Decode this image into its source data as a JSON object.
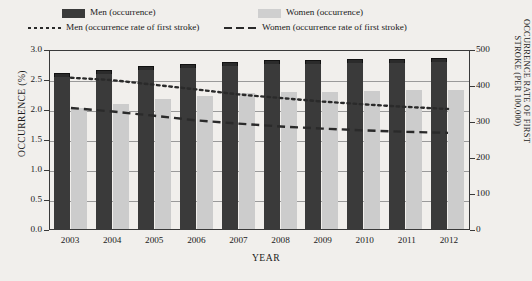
{
  "legend": {
    "entries": [
      {
        "name": "men-occurrence",
        "label": "Men (occurrence)",
        "marker": "solid-swatch-dark"
      },
      {
        "name": "women-occurrence",
        "label": "Women (occurrence)",
        "marker": "solid-swatch-light"
      },
      {
        "name": "men-rate",
        "label": "Men (occurrence rate of first stroke)",
        "marker": "dotted-line"
      },
      {
        "name": "women-rate",
        "label": "Women (occurrence rate of first stroke)",
        "marker": "dashed-line"
      }
    ]
  },
  "colors": {
    "men_bar": "#3a3a3a",
    "women_bar": "#cccccc",
    "line": "#2a2a2a",
    "axis": "#3a3a3a",
    "grid": "#9a9a9a",
    "background": "#f1efec"
  },
  "chart_data": {
    "type": "bar",
    "title": "",
    "xlabel": "YEAR",
    "ylabel": "OCCURRENCE (%)",
    "ylabel_right": "OCCURRENCE RATE OF FIRST STROKE (PER 100,000)",
    "categories": [
      "2003",
      "2004",
      "2005",
      "2006",
      "2007",
      "2008",
      "2009",
      "2010",
      "2011",
      "2012"
    ],
    "ylim": [
      0,
      3.0
    ],
    "yticks": [
      "0.0",
      "0.5",
      "1.0",
      "1.5",
      "2.0",
      "2.5",
      "3.0"
    ],
    "ylim_right": [
      0,
      500
    ],
    "yticks_right": [
      "0",
      "100",
      "200",
      "300",
      "400",
      "500"
    ],
    "grid": true,
    "legend_position": "top",
    "series": [
      {
        "name": "Men (occurrence)",
        "axis": "left",
        "unit": "%",
        "type": "bar",
        "values": [
          2.57,
          2.62,
          2.68,
          2.72,
          2.75,
          2.78,
          2.79,
          2.8,
          2.8,
          2.81
        ],
        "error_bars": true
      },
      {
        "name": "Women (occurrence)",
        "axis": "left",
        "unit": "%",
        "type": "bar",
        "values": [
          2.02,
          2.08,
          2.17,
          2.22,
          2.26,
          2.28,
          2.29,
          2.3,
          2.31,
          2.32
        ]
      },
      {
        "name": "Men (occurrence rate of first stroke)",
        "axis": "right",
        "unit": "per 100,000",
        "type": "line",
        "linestyle": "dotted",
        "values": [
          425,
          418,
          405,
          392,
          378,
          368,
          358,
          350,
          343,
          337
        ]
      },
      {
        "name": "Women (occurrence rate of first stroke)",
        "axis": "right",
        "unit": "per 100,000",
        "type": "line",
        "linestyle": "dashed",
        "values": [
          340,
          330,
          318,
          305,
          296,
          288,
          282,
          277,
          273,
          270
        ]
      }
    ]
  }
}
